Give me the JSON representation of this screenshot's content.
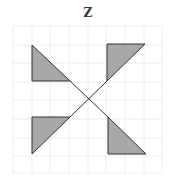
{
  "title": "Z",
  "colors": {
    "grid": "#eeeeee",
    "fill": "#a8a8a8",
    "stroke": "#333333"
  },
  "grid": {
    "x_lines": [
      13,
      32,
      50,
      69,
      88,
      106,
      125,
      144,
      162
    ],
    "y_lines": [
      26,
      45,
      63,
      82,
      100,
      119,
      138,
      156,
      173
    ]
  },
  "shapes": {
    "triangles": [
      {
        "name": "top-left",
        "points": "32,45 32,81 70,81"
      },
      {
        "name": "top-right",
        "points": "107,44 145,44 107,81"
      },
      {
        "name": "bottom-left",
        "points": "32,117 70,117 32,154"
      },
      {
        "name": "bottom-right",
        "points": "108,117 108,154 146,154"
      }
    ],
    "diagonals": [
      {
        "x1": 70,
        "y1": 81,
        "x2": 108,
        "y2": 117
      },
      {
        "x1": 107,
        "y1": 81,
        "x2": 70,
        "y2": 117
      }
    ]
  }
}
